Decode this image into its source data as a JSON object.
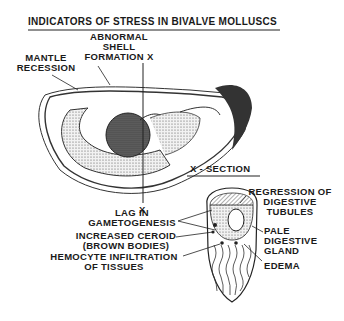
{
  "title": "INDICATORS OF STRESS IN BIVALVE MOLLUSCS",
  "whole_animal": {
    "labels": {
      "abnormal_shell": [
        "ABNORMAL",
        "SHELL",
        "FORMATION X"
      ],
      "mantle_recession": [
        "MANTLE",
        "RECESSION"
      ],
      "section_marker_bottom": "X"
    }
  },
  "cross_section": {
    "title": "X - SECTION",
    "labels": {
      "lag_gametogenesis": [
        "LAG IN",
        "GAMETOGENESIS"
      ],
      "increased_ceroid": [
        "INCREASED CEROID",
        "(BROWN BODIES)"
      ],
      "hemocyte": [
        "HEMOCYTE INFILTRATION",
        "OF TISSUES"
      ],
      "regression": [
        "REGRESSION OF",
        "DIGESTIVE",
        "TUBULES"
      ],
      "pale_gland": [
        "PALE",
        "DIGESTIVE",
        "GLAND"
      ],
      "edema": "EDEMA"
    }
  }
}
